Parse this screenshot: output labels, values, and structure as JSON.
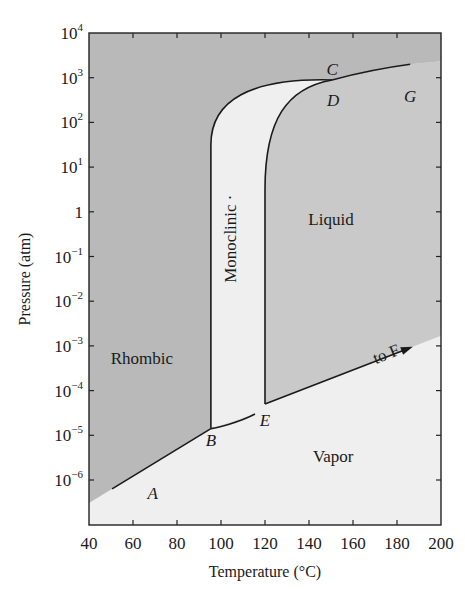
{
  "chart_data": {
    "type": "area",
    "title": "",
    "xlabel": "Temperature (°C)",
    "ylabel": "Pressure (atm)",
    "xlim": [
      40,
      200
    ],
    "ylim_log10": [
      -7,
      4
    ],
    "yscale": "log",
    "grid": false,
    "legend": "none",
    "x_ticks": [
      40,
      60,
      80,
      100,
      120,
      140,
      160,
      180,
      200
    ],
    "x_tick_labels": [
      "40",
      "60",
      "80",
      "100",
      "120",
      "140",
      "160",
      "180",
      "200"
    ],
    "y_ticks_log10": [
      4,
      3,
      2,
      1,
      0,
      -1,
      -2,
      -3,
      -4,
      -5,
      -6
    ],
    "y_tick_labels": [
      {
        "base": "10",
        "exp": "4"
      },
      {
        "base": "10",
        "exp": "3"
      },
      {
        "base": "10",
        "exp": "2"
      },
      {
        "base": "10",
        "exp": "1"
      },
      {
        "base": "1",
        "exp": ""
      },
      {
        "base": "10",
        "exp": "−1"
      },
      {
        "base": "10",
        "exp": "−2"
      },
      {
        "base": "10",
        "exp": "−3"
      },
      {
        "base": "10",
        "exp": "−4"
      },
      {
        "base": "10",
        "exp": "−5"
      },
      {
        "base": "10",
        "exp": "−6"
      }
    ],
    "regions": [
      {
        "name": "Rhombic",
        "color": "#b9b9b9",
        "label_at": {
          "T": 64,
          "log10P": -3.4
        }
      },
      {
        "name": "Monoclinic",
        "color": "#dedede",
        "label_at": {
          "T": 107,
          "log10P": -0.6
        },
        "rotated": true
      },
      {
        "name": "Liquid",
        "color": "#c9c9c9",
        "label_at": {
          "T": 150,
          "log10P": -0.3
        }
      },
      {
        "name": "Vapor",
        "color": "#efefef",
        "label_at": {
          "T": 151,
          "log10P": -5.6
        }
      }
    ],
    "points": [
      {
        "label": "A",
        "T": 69,
        "log10P": -6.3
      },
      {
        "label": "B",
        "T": 95.4,
        "log10P": -5.1
      },
      {
        "label": "C",
        "T": 150.5,
        "log10P": 3.2
      },
      {
        "label": "D",
        "T": 151,
        "log10P": 2.5
      },
      {
        "label": "E",
        "T": 120,
        "log10P": -4.65
      },
      {
        "label": "G",
        "T": 186,
        "log10P": 2.6
      }
    ],
    "curves": [
      {
        "name": "A-B sublimation (rhombic/vapor)",
        "points": [
          [
            50.5,
            -6.2
          ],
          [
            95.4,
            -4.85
          ]
        ]
      },
      {
        "name": "B-E sublimation (monoclinic/vapor)",
        "points": [
          [
            95.4,
            -4.85
          ],
          [
            120,
            -4.3
          ]
        ]
      },
      {
        "name": "E-F vaporization (liquid/vapor)",
        "points": [
          [
            120,
            -4.3
          ],
          [
            185.5,
            -3.05
          ]
        ],
        "arrow": true
      },
      {
        "name": "B-C rhombic/monoclinic",
        "points": [
          [
            95.4,
            -4.85
          ],
          [
            95.4,
            1.5
          ],
          [
            150.5,
            2.95
          ]
        ]
      },
      {
        "name": "E-C monoclinic/liquid",
        "points": [
          [
            120,
            -4.3
          ],
          [
            120,
            0.5
          ],
          [
            150.5,
            2.95
          ]
        ]
      },
      {
        "name": "C-G rhombic/liquid",
        "points": [
          [
            150.5,
            2.95
          ],
          [
            186,
            3.3
          ]
        ]
      }
    ],
    "annotations": [
      {
        "text": "to F",
        "T": 176,
        "log10P": -3.3,
        "rotation": -22
      }
    ]
  }
}
